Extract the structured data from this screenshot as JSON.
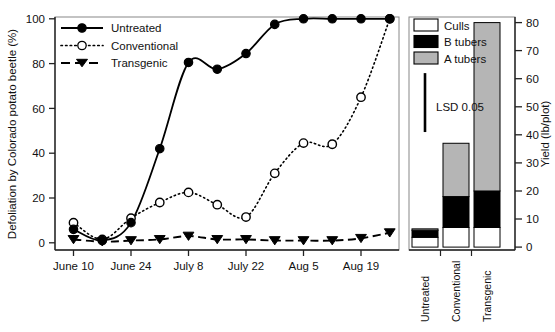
{
  "figure": {
    "title": "",
    "left_panel": {
      "ylabel": "Defoliation by Colorado potato beetle (%)",
      "yticks": [
        0,
        20,
        40,
        60,
        80,
        100
      ],
      "ylim": [
        0,
        104
      ],
      "xticks": [
        "June 10",
        "June 24",
        "July 8",
        "July 22",
        "Aug 5",
        "Aug 19"
      ],
      "legend": [
        {
          "label": "Untreated",
          "style": "solid",
          "marker": "filled-circle",
          "color": "#000000"
        },
        {
          "label": "Conventional",
          "style": "dotted",
          "marker": "open-circle",
          "color": "#000000"
        },
        {
          "label": "Transgenic",
          "style": "dashed",
          "marker": "filled-triangle-down",
          "color": "#000000"
        }
      ]
    },
    "right_panel": {
      "ylabel": "Yield (lb/plot)",
      "yticks": [
        0,
        10,
        20,
        30,
        40,
        50,
        60,
        70,
        80
      ],
      "ylim": [
        0,
        83
      ],
      "categories": [
        "Untreated",
        "Conventional",
        "Transgenic"
      ],
      "legend": [
        {
          "label": "Culls",
          "fill": "#ffffff"
        },
        {
          "label": "B tubers",
          "fill": "#000000"
        },
        {
          "label": "A tubers",
          "fill": "#b5b5b5"
        }
      ],
      "lsd": {
        "label": "LSD 0.05",
        "from": 41,
        "to": 62
      }
    }
  },
  "chart_data": [
    {
      "type": "line",
      "panel": "left",
      "title": "",
      "xlabel": "",
      "ylabel": "Defoliation by Colorado potato beetle (%)",
      "ylim": [
        0,
        104
      ],
      "yticks": [
        0,
        20,
        40,
        60,
        80,
        100
      ],
      "xtick_labels": [
        "June 10",
        "June 24",
        "July 8",
        "July 22",
        "Aug 5",
        "Aug 19"
      ],
      "xtick_positions": [
        0,
        2,
        4,
        6,
        8,
        10
      ],
      "x": [
        0,
        1,
        2,
        3,
        4,
        5,
        6,
        7,
        8,
        9,
        10,
        11
      ],
      "grid": false,
      "legend_position": "top-left",
      "series": [
        {
          "name": "Untreated",
          "marker": "filled-circle",
          "linestyle": "solid",
          "values": [
            6,
            1,
            9,
            42,
            80.5,
            77.5,
            84.5,
            97.5,
            100,
            100,
            100,
            100
          ]
        },
        {
          "name": "Conventional",
          "marker": "open-circle",
          "linestyle": "dotted",
          "values": [
            9,
            1.5,
            11,
            18,
            22.5,
            17,
            11.5,
            31,
            44.5,
            44,
            65,
            100
          ]
        },
        {
          "name": "Transgenic",
          "marker": "filled-triangle-down",
          "linestyle": "dashed",
          "values": [
            1.5,
            0.5,
            1,
            1.5,
            3,
            1.5,
            1.5,
            1,
            1,
            1,
            2,
            4.5
          ]
        }
      ]
    },
    {
      "type": "bar",
      "panel": "right",
      "subtype": "stacked",
      "title": "",
      "xlabel": "",
      "ylabel": "Yield (lb/plot)",
      "ylim": [
        0,
        83
      ],
      "yticks": [
        0,
        10,
        20,
        30,
        40,
        50,
        60,
        70,
        80
      ],
      "categories": [
        "Untreated",
        "Conventional",
        "Transgenic"
      ],
      "series": [
        {
          "name": "Culls",
          "fill": "#ffffff",
          "values": [
            3.5,
            7,
            7
          ]
        },
        {
          "name": "B tubers",
          "fill": "#000000",
          "values": [
            2.5,
            11,
            13
          ]
        },
        {
          "name": "A tubers",
          "fill": "#b5b5b5",
          "values": [
            0.5,
            19,
            60
          ]
        }
      ],
      "totals": [
        6.5,
        37,
        80
      ],
      "annotation": {
        "label": "LSD 0.05",
        "value_span": [
          41,
          62
        ]
      }
    }
  ]
}
